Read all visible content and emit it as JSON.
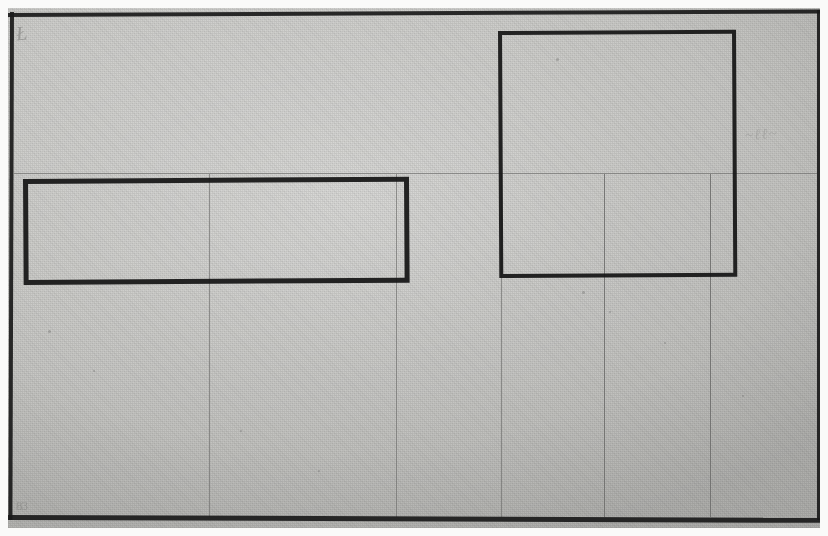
{
  "document": {
    "kind": "scanned-drawing-photograph",
    "title": "Gridded sheet with two heavy ink rectangles",
    "sheet_color": "#c9c9c6",
    "frame_color": "#1a1a1a",
    "ink_color": "#151515",
    "gridline_color": "#6f6f6d",
    "pencil_color": "#7a7a78"
  },
  "annotations": {
    "top_left_mark": "Ł",
    "bottom_left_mark": "83",
    "right_edge_mark": "~ℓℓ~"
  },
  "drawing": {
    "frame": {
      "left": 11,
      "top": 14,
      "right": 818,
      "bottom": 517
    },
    "grid": {
      "vertical_lines_x": [
        209,
        396,
        501,
        604,
        710
      ],
      "horizontal_lines_y": [
        173
      ],
      "line_weight_px": 1
    },
    "rectangles": [
      {
        "name": "left-rectangle",
        "x": 23,
        "y": 179,
        "width": 386,
        "height": 106,
        "stroke_px": 5
      },
      {
        "name": "right-rectangle",
        "x": 498,
        "y": 31,
        "width": 238,
        "height": 247,
        "stroke_px": 4
      }
    ],
    "specks": [
      {
        "x": 48,
        "y": 330,
        "size": 3
      },
      {
        "x": 93,
        "y": 370,
        "size": 2
      },
      {
        "x": 240,
        "y": 430,
        "size": 2
      },
      {
        "x": 556,
        "y": 58,
        "size": 3
      },
      {
        "x": 582,
        "y": 291,
        "size": 3
      },
      {
        "x": 609,
        "y": 311,
        "size": 2
      },
      {
        "x": 742,
        "y": 395,
        "size": 2
      },
      {
        "x": 318,
        "y": 470,
        "size": 2
      },
      {
        "x": 664,
        "y": 342,
        "size": 2
      }
    ]
  }
}
